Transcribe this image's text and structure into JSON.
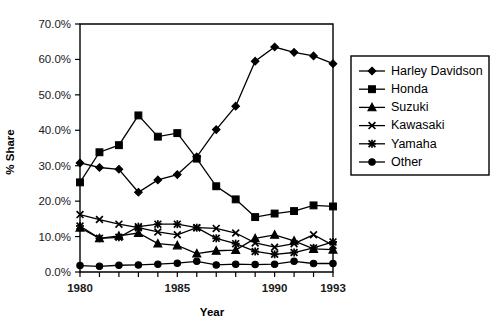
{
  "chart_data": {
    "type": "line",
    "title": "",
    "xlabel": "Year",
    "ylabel": "% Share",
    "x": [
      1980,
      1981,
      1982,
      1983,
      1984,
      1985,
      1986,
      1987,
      1988,
      1989,
      1990,
      1991,
      1992,
      1993
    ],
    "xlim": [
      1980,
      1993
    ],
    "ylim": [
      0,
      70
    ],
    "yticks": [
      0,
      10,
      20,
      30,
      40,
      50,
      60,
      70
    ],
    "ytick_labels": [
      "0.0%",
      "10.0%",
      "20.0%",
      "30.0%",
      "40.0%",
      "50.0%",
      "60.0%",
      "70.0%"
    ],
    "xticks": [
      1980,
      1981,
      1982,
      1983,
      1984,
      1985,
      1986,
      1987,
      1988,
      1989,
      1990,
      1991,
      1992,
      1993
    ],
    "xtick_labels_shown": [
      "1980",
      "1985",
      "1990",
      "1993"
    ],
    "grid": false,
    "legend_position": "right-outside",
    "series": [
      {
        "name": "Harley Davidson",
        "marker": "diamond",
        "values": [
          30.8,
          29.5,
          29.0,
          22.5,
          26.0,
          27.5,
          32.5,
          40.2,
          46.8,
          59.5,
          63.5,
          62.0,
          61.0,
          58.8
        ]
      },
      {
        "name": "Honda",
        "marker": "square",
        "values": [
          25.3,
          33.8,
          35.8,
          44.2,
          38.2,
          39.2,
          32.0,
          24.2,
          20.5,
          15.5,
          16.5,
          17.2,
          18.8,
          18.5
        ]
      },
      {
        "name": "Suzuki",
        "marker": "triangle",
        "values": [
          12.5,
          9.5,
          10.2,
          11.0,
          8.0,
          7.5,
          5.2,
          6.0,
          6.2,
          9.5,
          10.5,
          8.8,
          6.5,
          6.3
        ]
      },
      {
        "name": "Kawasaki",
        "marker": "x",
        "values": [
          16.2,
          14.8,
          13.5,
          12.5,
          11.3,
          10.5,
          12.5,
          12.3,
          11.0,
          8.2,
          7.0,
          8.0,
          10.5,
          7.5
        ]
      },
      {
        "name": "Yamaha",
        "marker": "asterisk",
        "values": [
          13.0,
          9.5,
          9.8,
          12.8,
          13.5,
          13.5,
          12.5,
          9.5,
          8.0,
          5.8,
          5.0,
          5.5,
          6.8,
          8.5
        ]
      },
      {
        "name": "Other",
        "marker": "circle",
        "values": [
          1.8,
          1.6,
          1.9,
          2.0,
          2.2,
          2.5,
          3.0,
          2.0,
          2.2,
          2.1,
          2.2,
          3.0,
          2.4,
          2.4
        ]
      }
    ]
  },
  "legend": {
    "items": [
      {
        "label": "Harley Davidson",
        "marker": "diamond"
      },
      {
        "label": "Honda",
        "marker": "square"
      },
      {
        "label": "Suzuki",
        "marker": "triangle"
      },
      {
        "label": "Kawasaki",
        "marker": "x"
      },
      {
        "label": "Yamaha",
        "marker": "asterisk"
      },
      {
        "label": "Other",
        "marker": "circle"
      }
    ]
  },
  "colors": {
    "foreground": "#000000",
    "background": "#ffffff",
    "tick_label": "#1a1a1a"
  }
}
